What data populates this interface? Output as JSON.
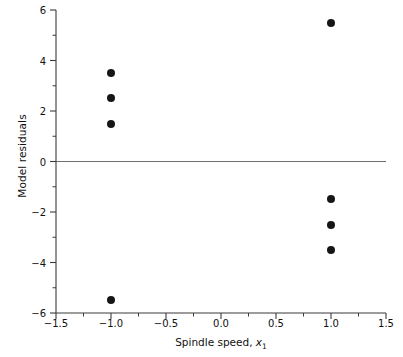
{
  "chart_data": {
    "type": "scatter",
    "title": "",
    "xlabel": "Spindle speed, x1",
    "xlabel_main": "Spindle speed, ",
    "xlabel_var": "x",
    "xlabel_sub": "1",
    "ylabel": "Model residuals",
    "xlim": [
      -1.5,
      1.5
    ],
    "ylim": [
      -6,
      6
    ],
    "grid": false,
    "legend": "none",
    "x_major_ticks": [
      -1.5,
      -1.0,
      -0.5,
      0.0,
      0.5,
      1.0,
      1.5
    ],
    "x_major_tick_labels": [
      "-1.5",
      "-1.0",
      "-0.5",
      "0.0",
      "0.5",
      "1.0",
      "1.5"
    ],
    "x_minor_ticks": [
      -1.25,
      -0.75,
      -0.25,
      0.25,
      0.75,
      1.25
    ],
    "y_major_ticks": [
      6,
      4,
      2,
      0,
      -2,
      -4,
      -6
    ],
    "y_major_tick_labels": [
      "6",
      "4",
      "2",
      "0",
      "-2",
      "-4",
      "-6"
    ],
    "y_minor_ticks": [
      5,
      3,
      1,
      -1,
      -3,
      -5
    ],
    "reference_line": {
      "orientation": "horizontal",
      "value": 0,
      "color": "#6e6e6e"
    },
    "marker": {
      "shape": "circle",
      "color": "#161616",
      "size_px": 8
    },
    "points": [
      {
        "x": -1.0,
        "y": 3.5
      },
      {
        "x": -1.0,
        "y": 2.5
      },
      {
        "x": -1.0,
        "y": 1.5
      },
      {
        "x": -1.0,
        "y": -5.5
      },
      {
        "x": 1.0,
        "y": 5.5
      },
      {
        "x": 1.0,
        "y": -1.5
      },
      {
        "x": 1.0,
        "y": -2.5
      },
      {
        "x": 1.0,
        "y": -3.5
      }
    ]
  },
  "axes_geometry": {
    "plot_left_px": 56,
    "plot_right_px": 386,
    "plot_top_px": 10,
    "plot_bottom_px": 313,
    "axis_color": "#3b3b3b",
    "major_tick_len_px": 6,
    "minor_tick_len_px": 3.5
  }
}
